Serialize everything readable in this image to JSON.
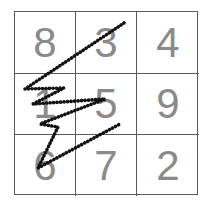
{
  "grid": {
    "rows": 3,
    "cols": 3,
    "cells": [
      [
        "8",
        "3",
        "4"
      ],
      [
        "1",
        "5",
        "9"
      ],
      [
        "6",
        "7",
        "2"
      ]
    ],
    "text_color": "#8a8a8a",
    "line_color": "#5a5a5a"
  },
  "stroke": {
    "color": "#111111",
    "style": "dotted",
    "points": [
      [
        124,
        23
      ],
      [
        25,
        89
      ],
      [
        64,
        88
      ],
      [
        33,
        104
      ],
      [
        105,
        99
      ],
      [
        40,
        124
      ],
      [
        58,
        127
      ],
      [
        38,
        168
      ],
      [
        120,
        124
      ]
    ]
  }
}
